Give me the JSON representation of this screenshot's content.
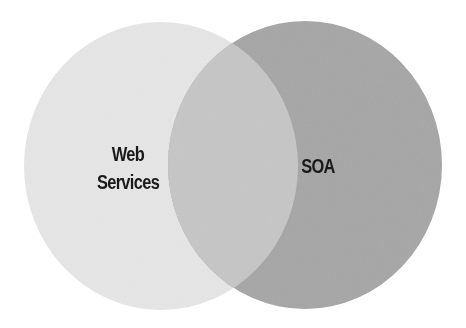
{
  "diagram": {
    "type": "venn",
    "sets": [
      {
        "id": "left",
        "label_lines": [
          "Web",
          "Services"
        ],
        "color": "#e6e6e6"
      },
      {
        "id": "right",
        "label_lines": [
          "SOA"
        ],
        "color": "#a6a6a6"
      }
    ],
    "overlap": {
      "sets": [
        "left",
        "right"
      ],
      "label": "",
      "color": "#c6c6c6"
    },
    "label_color": "#1a1a1a",
    "background": "#ffffff"
  }
}
